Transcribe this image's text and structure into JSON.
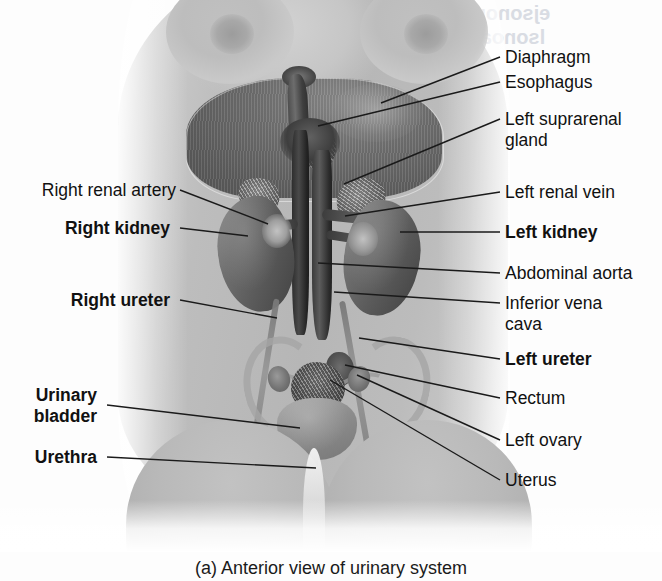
{
  "figure": {
    "caption": "(a) Anterior view of urinary system",
    "view": "Anterior view of urinary system",
    "panel_letter": "(a)"
  },
  "colors": {
    "page_background": "#ffffff",
    "skin_gray": "#b8b8b8",
    "diaphragm_gray": "#6a6a6a",
    "vessel_dark": "#3a3a3a",
    "label_text": "#111111",
    "leader_line": "#1a1a1a",
    "showthrough": "#d9dce3"
  },
  "labels_right": [
    {
      "id": "diaphragm",
      "text": "Diaphragm",
      "bold": false
    },
    {
      "id": "esophagus",
      "text": "Esophagus",
      "bold": false
    },
    {
      "id": "left-suprarenal-gland",
      "text": "Left suprarenal\ngland",
      "bold": false
    },
    {
      "id": "left-renal-vein",
      "text": "Left renal vein",
      "bold": false
    },
    {
      "id": "left-kidney",
      "text": "Left kidney",
      "bold": true
    },
    {
      "id": "abdominal-aorta",
      "text": "Abdominal aorta",
      "bold": false
    },
    {
      "id": "inferior-vena-cava",
      "text": "Inferior vena\ncava",
      "bold": false
    },
    {
      "id": "left-ureter",
      "text": "Left ureter",
      "bold": true
    },
    {
      "id": "rectum",
      "text": "Rectum",
      "bold": false
    },
    {
      "id": "left-ovary",
      "text": "Left ovary",
      "bold": false
    },
    {
      "id": "uterus",
      "text": "Uterus",
      "bold": false
    }
  ],
  "labels_left": [
    {
      "id": "right-renal-artery",
      "text": "Right renal artery",
      "bold": false
    },
    {
      "id": "right-kidney",
      "text": "Right kidney",
      "bold": true
    },
    {
      "id": "right-ureter",
      "text": "Right ureter",
      "bold": true
    },
    {
      "id": "urinary-bladder",
      "text": "Urinary\nbladder",
      "bold": true
    },
    {
      "id": "urethra",
      "text": "Urethra",
      "bold": true
    }
  ],
  "showthrough_text": {
    "line1": "ejsonou eonnes",
    "line2": "lsonoanindesd"
  }
}
